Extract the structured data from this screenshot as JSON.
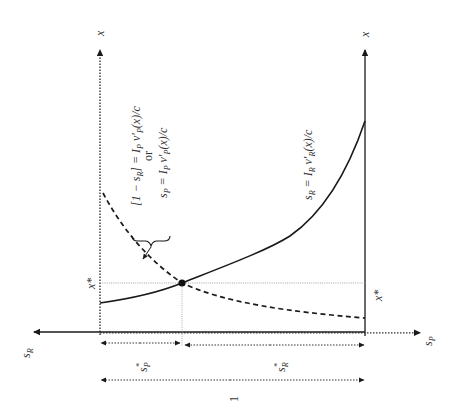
{
  "diagram": {
    "type": "economic-equilibrium-diagram",
    "orientation": "rotated-90-ccw",
    "axes": {
      "left_vertical": {
        "label": "x",
        "style": "dotted"
      },
      "right_vertical": {
        "label": "x",
        "style": "solid"
      },
      "horizontal_left": {
        "label": "s_R",
        "style": "solid"
      },
      "horizontal_right": {
        "label": "s_P",
        "style": "dotted"
      }
    },
    "curves": {
      "solid": {
        "label": "s_R = I_R v'_R(x)/c",
        "style": "solid"
      },
      "dashed": {
        "label_line1": "[1 − s_R] = I_P v'_P(x)/c",
        "label_or": "or",
        "label_line2": "s_P = I_P v'_P(x)/c",
        "style": "dashed"
      }
    },
    "equilibrium": {
      "x_star_left": "x*",
      "x_star_right": "x*",
      "s_P_star": "s*_P",
      "s_R_star": "s*_R",
      "total_width_label": "1"
    },
    "colors": {
      "line": "#1a1a1a",
      "dotted": "#333333",
      "guide": "#9a9a9a",
      "text": "#333333"
    }
  },
  "labels": {
    "x_left": "x",
    "x_right": "x",
    "s_R_axis_s": "s",
    "s_R_axis_sub": "R",
    "s_P_axis_s": "s",
    "s_P_axis_sub": "P",
    "curve_R": "s",
    "curve_R_sub": "R",
    "curve_R_rest": " = I",
    "curve_R_I_sub": "R",
    "curve_R_v": " v′",
    "curve_R_v_sub": "R",
    "curve_R_tail": "(x)/c",
    "curve_P1_head": "[1 − s",
    "curve_P1_sub": "R",
    "curve_P1_mid": "] = I",
    "curve_P1_I_sub": "P",
    "curve_P1_v": " v′",
    "curve_P1_v_sub": "P",
    "curve_P1_tail": "(x)/c",
    "curve_or": "or",
    "curve_P2_head": "s",
    "curve_P2_sub": "P",
    "curve_P2_mid": " = I",
    "curve_P2_I_sub": "P",
    "curve_P2_v": " v′",
    "curve_P2_v_sub": "P",
    "curve_P2_tail": "(x)/c",
    "x_star_left": "x*",
    "x_star_right": "x*",
    "sP_star_s": "s",
    "sP_star_sup": "*",
    "sP_star_sub": "P",
    "sR_star_s": "s",
    "sR_star_sup": "*",
    "sR_star_sub": "R",
    "one": "1"
  }
}
